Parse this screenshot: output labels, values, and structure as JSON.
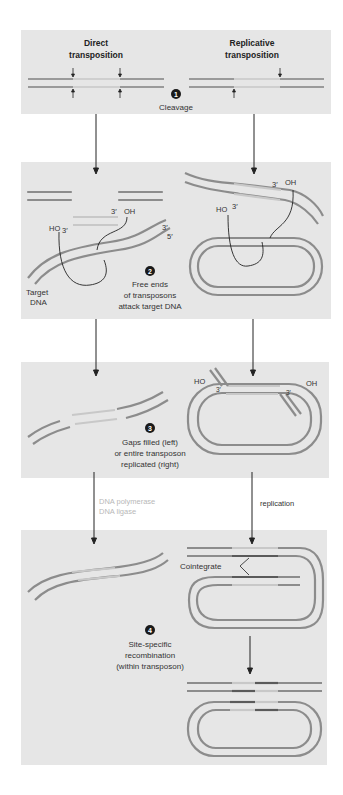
{
  "headers": {
    "left": [
      "Direct",
      "transposition"
    ],
    "right": [
      "Replicative",
      "transposition"
    ]
  },
  "steps": [
    {
      "number": "1",
      "lines": [
        "Cleavage"
      ]
    },
    {
      "number": "2",
      "lines": [
        "Free ends",
        "of transposons",
        "attack target DNA"
      ]
    },
    {
      "number": "3",
      "lines": [
        "Gaps filled (left)",
        "or entire transposon",
        "replicated (right)"
      ]
    },
    {
      "number": "4",
      "lines": [
        "Site-specific",
        "recombination",
        "(within transposon)"
      ]
    }
  ],
  "labels": {
    "target_dna": [
      "Target",
      "DNA"
    ],
    "three_prime": "3′",
    "five_prime": "5′",
    "ho": "HO",
    "oh": "OH",
    "dna_polymerase": "DNA polymerase",
    "dna_ligase": "DNA ligase",
    "replication": "replication",
    "cointegrate": "Cointegrate"
  },
  "colors": {
    "panel_bg": "#e6e6e6",
    "strand": "#8c8c8c",
    "strand_dark": "#5a5a5a",
    "strand_light": "#c8c8c8",
    "arrow": "#222222",
    "step_badge": "#1a1a1a"
  }
}
